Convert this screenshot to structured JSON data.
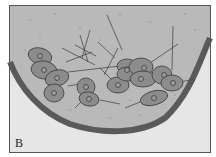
{
  "figure": {
    "panel_label": "B",
    "colors": {
      "frame_border": "#555555",
      "medium_fill": "#b9b9b9",
      "outside_fill": "#e6e6e6",
      "wall": "#5a5a5a",
      "cell_fill": "#8c8c8c",
      "cell_stroke": "#3a3a3a",
      "process_line": "#4a4a4a"
    }
  }
}
